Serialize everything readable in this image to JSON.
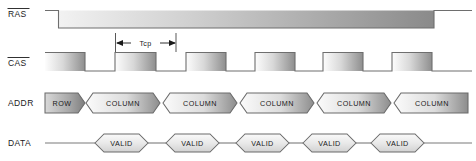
{
  "diagram": {
    "width": 476,
    "height": 161,
    "background": "#ffffff",
    "line_color": "#6e6e6e",
    "text_color": "#1a1a1a"
  },
  "signals": [
    {
      "name": "RAS",
      "label": "RAS",
      "active_low": true,
      "overline": true,
      "type": "waveform",
      "label_x": 8,
      "label_y": 17,
      "baseline_y": 10,
      "low_y": 28,
      "transitions": [
        {
          "x": 45,
          "level": "high"
        },
        {
          "x": 58,
          "level": "low"
        },
        {
          "x": 434,
          "level": "high"
        },
        {
          "x": 472,
          "level": "high"
        }
      ]
    },
    {
      "name": "CAS",
      "label": "CAS",
      "active_low": true,
      "overline": true,
      "type": "waveform",
      "label_x": 8,
      "label_y": 66,
      "high_y": 52,
      "low_y": 71,
      "start_x": 45,
      "end_x": 472,
      "pulses": [
        {
          "start": 45,
          "end": 85
        },
        {
          "start": 115,
          "end": 156
        },
        {
          "start": 186,
          "end": 226
        },
        {
          "start": 255,
          "end": 295
        },
        {
          "start": 323,
          "end": 363
        },
        {
          "start": 392,
          "end": 432
        }
      ]
    },
    {
      "name": "ADDR",
      "label": "ADDR",
      "active_low": false,
      "overline": false,
      "type": "bus",
      "label_x": 8,
      "label_y": 105,
      "top_y": 93,
      "bottom_y": 113,
      "segments": [
        {
          "label": "ROW",
          "start": 45,
          "end": 83
        },
        {
          "label": "COLUMN",
          "start": 83,
          "end": 160
        },
        {
          "label": "COLUMN",
          "start": 160,
          "end": 237
        },
        {
          "label": "COLUMN",
          "start": 237,
          "end": 314
        },
        {
          "label": "COLUMN",
          "start": 314,
          "end": 391
        },
        {
          "label": "COLUMN",
          "start": 391,
          "end": 468
        }
      ]
    },
    {
      "name": "DATA",
      "label": "DATA",
      "active_low": false,
      "overline": false,
      "type": "data",
      "label_x": 8,
      "label_y": 145,
      "center_y": 143,
      "half_height": 9,
      "start_x": 45,
      "end_x": 472,
      "valid_windows": [
        {
          "label": "VALID",
          "start": 95,
          "end": 148
        },
        {
          "label": "VALID",
          "start": 166,
          "end": 219
        },
        {
          "label": "VALID",
          "start": 236,
          "end": 289
        },
        {
          "label": "VALID",
          "start": 303,
          "end": 356
        },
        {
          "label": "VALID",
          "start": 371,
          "end": 424
        }
      ]
    }
  ],
  "annotations": [
    {
      "name": "tcp-measurement",
      "label": "Tcp",
      "start_x": 115,
      "end_x": 176,
      "text_y": 43,
      "arrow_y": 43,
      "tick_top": 33,
      "tick_bottom": 52
    }
  ]
}
